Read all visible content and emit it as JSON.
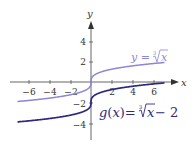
{
  "chart_data": {
    "type": "line",
    "title": "",
    "xlabel": "x",
    "ylabel": "y",
    "xlim": [
      -7.5,
      8
    ],
    "ylim": [
      -5.5,
      6
    ],
    "grid": false,
    "x_ticks": [
      -6,
      -4,
      -2,
      2,
      4,
      6
    ],
    "y_ticks": [
      4,
      2,
      -2,
      -4
    ],
    "x_tick_labels": [
      "−6",
      "−4",
      "−2",
      "2",
      "4",
      "6"
    ],
    "y_tick_labels": [
      "4",
      "2",
      "−2",
      "−4"
    ],
    "series": [
      {
        "name": "y = ∛x",
        "function": "cbrt(x)",
        "color": "#8c86d6",
        "x_range": [
          -7,
          7
        ],
        "points": [
          [
            -7,
            -1.91
          ],
          [
            -6,
            -1.82
          ],
          [
            -4,
            -1.59
          ],
          [
            -2,
            -1.26
          ],
          [
            -1,
            -1
          ],
          [
            0,
            0
          ],
          [
            1,
            1
          ],
          [
            2,
            1.26
          ],
          [
            4,
            1.59
          ],
          [
            6,
            1.82
          ],
          [
            7,
            1.91
          ]
        ]
      },
      {
        "name": "g(x) = ∛x − 2",
        "function": "cbrt(x) - 2",
        "color": "#2e2a80",
        "x_range": [
          -7,
          7
        ],
        "points": [
          [
            -7,
            -3.91
          ],
          [
            -6,
            -3.82
          ],
          [
            -4,
            -3.59
          ],
          [
            -2,
            -3.26
          ],
          [
            -1,
            -3
          ],
          [
            0,
            -2
          ],
          [
            1,
            -1
          ],
          [
            2,
            -0.74
          ],
          [
            4,
            -0.41
          ],
          [
            6,
            -0.18
          ],
          [
            7,
            -0.09
          ]
        ]
      }
    ],
    "annotations": [
      {
        "text": "y = ∛x",
        "attached_to": "y = ∛x",
        "position": "upper right"
      },
      {
        "text": "g(x) = ∛x − 2",
        "attached_to": "g(x) = ∛x − 2",
        "position": "lower right"
      }
    ]
  },
  "labels": {
    "x_axis": "x",
    "y_axis": "y",
    "upper_curve": {
      "lhs": "y",
      "eq": " = ",
      "root_index": "3",
      "radicand": "x"
    },
    "lower_curve": {
      "lhs": "g",
      "paren_open": "(",
      "arg": "x",
      "paren_close": ")",
      "eq": "=",
      "root_index": "3",
      "radicand": "x",
      "tail": " − 2"
    },
    "ticks": {
      "x": [
        "−6",
        "−4",
        "−2",
        "2",
        "4",
        "6"
      ],
      "y": [
        "4",
        "2",
        "−2",
        "−4"
      ]
    }
  },
  "colors": {
    "axis": "#555555",
    "upper_curve": "#8c86d6",
    "lower_curve": "#2e2a80",
    "upper_label": "#8c86d6",
    "lower_label": "#2e2a80"
  }
}
